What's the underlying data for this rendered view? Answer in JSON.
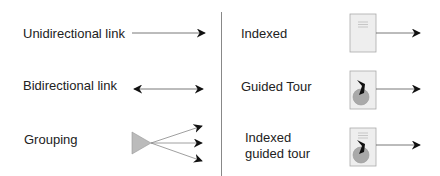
{
  "legend": {
    "left": [
      {
        "label": "Unidirectional link",
        "symbol": "unidirectional-arrow"
      },
      {
        "label": "Bidirectional link",
        "symbol": "bidirectional-arrow"
      },
      {
        "label": "Grouping",
        "symbol": "grouping-triangle-fan"
      }
    ],
    "right": [
      {
        "label": "Indexed",
        "symbol": "indexed-page"
      },
      {
        "label": "Guided Tour",
        "symbol": "guided-tour-page"
      },
      {
        "label_line1": "Indexed",
        "label_line2": "guided tour",
        "symbol": "indexed-guided-tour-page"
      }
    ]
  },
  "colors": {
    "text": "#222222",
    "line": "#555555",
    "arrowhead": "#111111",
    "page_fill": "#eeeeee",
    "page_border": "#aaaaaa",
    "triangle_fill": "#bbbbbb",
    "disc_fill": "#a9a9a9",
    "divider": "#888888"
  }
}
